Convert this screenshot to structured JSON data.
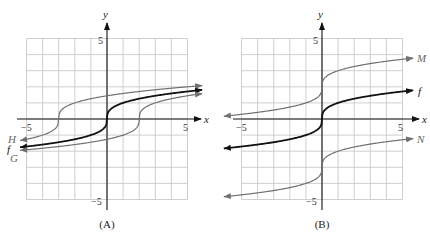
{
  "chart_data": [
    {
      "type": "line",
      "panel": "A",
      "caption": "(A)",
      "xlabel": "x",
      "ylabel": "y",
      "xlim": [
        -5,
        5
      ],
      "ylim": [
        -5,
        5
      ],
      "grid": true,
      "tick_labels": {
        "x_min": "−5",
        "x_max": "5",
        "y_min": "−5",
        "y_max": "5"
      },
      "series": [
        {
          "name": "H",
          "label": "H",
          "formula": "cbrt(x+3)",
          "shift_x": -3,
          "shift_y": 0,
          "color": "#707070",
          "x_range": [
            -5.4,
            5.9
          ],
          "points": [
            [
              -5.4,
              -1.34
            ],
            [
              -4,
              -1
            ],
            [
              -3,
              0
            ],
            [
              -2,
              1
            ],
            [
              0,
              1.44
            ],
            [
              2,
              1.71
            ],
            [
              5,
              2
            ],
            [
              5.9,
              2.07
            ]
          ]
        },
        {
          "name": "f",
          "label": "f",
          "formula": "cbrt(x)",
          "shift_x": 0,
          "shift_y": 0,
          "color": "#111111",
          "x_range": [
            -5.4,
            5.9
          ],
          "points": [
            [
              -5.4,
              -1.75
            ],
            [
              -1,
              -1
            ],
            [
              0,
              0
            ],
            [
              1,
              1
            ],
            [
              5,
              1.71
            ],
            [
              5.9,
              1.81
            ]
          ]
        },
        {
          "name": "G",
          "label": "G",
          "formula": "cbrt(x-2)",
          "shift_x": 2,
          "shift_y": 0,
          "color": "#707070",
          "x_range": [
            -5.4,
            5.9
          ],
          "points": [
            [
              -5.4,
              -1.95
            ],
            [
              1,
              -1
            ],
            [
              2,
              0
            ],
            [
              3,
              1
            ],
            [
              5,
              1.44
            ],
            [
              5.9,
              1.57
            ]
          ]
        }
      ]
    },
    {
      "type": "line",
      "panel": "B",
      "caption": "(B)",
      "xlabel": "x",
      "ylabel": "y",
      "xlim": [
        -5,
        5
      ],
      "ylim": [
        -5,
        5
      ],
      "grid": true,
      "tick_labels": {
        "x_min": "−5",
        "x_max": "5",
        "y_min": "−5",
        "y_max": "5"
      },
      "series": [
        {
          "name": "M",
          "label": "M",
          "formula": "cbrt(x)+2",
          "shift_x": 0,
          "shift_y": 2,
          "color": "#707070",
          "x_range": [
            -6.1,
            5.65
          ],
          "points": [
            [
              -6.1,
              0.17
            ],
            [
              -1,
              1
            ],
            [
              0,
              2
            ],
            [
              1,
              3
            ],
            [
              5,
              3.71
            ],
            [
              5.65,
              3.78
            ]
          ]
        },
        {
          "name": "f",
          "label": "f",
          "formula": "cbrt(x)",
          "shift_x": 0,
          "shift_y": 0,
          "color": "#111111",
          "x_range": [
            -6.1,
            5.65
          ],
          "points": [
            [
              -6.1,
              -1.83
            ],
            [
              -1,
              -1
            ],
            [
              0,
              0
            ],
            [
              1,
              1
            ],
            [
              5,
              1.71
            ],
            [
              5.65,
              1.78
            ]
          ]
        },
        {
          "name": "N",
          "label": "N",
          "formula": "cbrt(x)-3",
          "shift_x": 0,
          "shift_y": -3,
          "color": "#707070",
          "x_range": [
            -6.1,
            5.65
          ],
          "points": [
            [
              -6.1,
              -4.83
            ],
            [
              -1,
              -4
            ],
            [
              0,
              -3
            ],
            [
              1,
              -2
            ],
            [
              5,
              -1.29
            ],
            [
              5.65,
              -1.22
            ]
          ]
        }
      ]
    }
  ],
  "panels": [
    {
      "origin": [
        107,
        119
      ],
      "unit": 16.1,
      "axis_x": [
        17,
        201
      ],
      "axis_y": [
        210,
        23
      ],
      "labels": [
        {
          "series": 0,
          "x": 8,
          "y": 143
        },
        {
          "series": 1,
          "x": 7,
          "y": 153
        },
        {
          "series": 2,
          "x": 10,
          "y": 162
        }
      ]
    },
    {
      "origin": [
        322,
        119
      ],
      "unit": 16.1,
      "axis_x": [
        233,
        419
      ],
      "axis_y": [
        210,
        23
      ],
      "labels": [
        {
          "series": 0,
          "x": 417,
          "y": 62
        },
        {
          "series": 1,
          "x": 418,
          "y": 95
        },
        {
          "series": 2,
          "x": 417,
          "y": 143
        }
      ]
    }
  ]
}
